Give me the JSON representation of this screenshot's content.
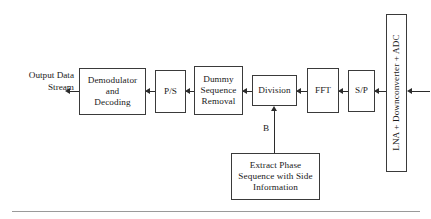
{
  "diagram": {
    "stroke_color": "#2b2b2b",
    "box_border_color": "#3a3a3a",
    "background_color": "#ffffff",
    "rule_color": "#9a9a9a"
  },
  "output_label": "Output Data\nStream",
  "blocks": {
    "demodulator": "Demodulator\nand\nDecoding",
    "ps": "P/S",
    "dummy_removal": "Dummy\nSequence\nRemoval",
    "division": "Division",
    "fft": "FFT",
    "sp": "S/P",
    "front_end": "LNA + Downconverter + ADC",
    "extract_phase": "Extract Phase\nSequence with Side\nInformation"
  },
  "edge_labels": {
    "feedback": "B"
  }
}
